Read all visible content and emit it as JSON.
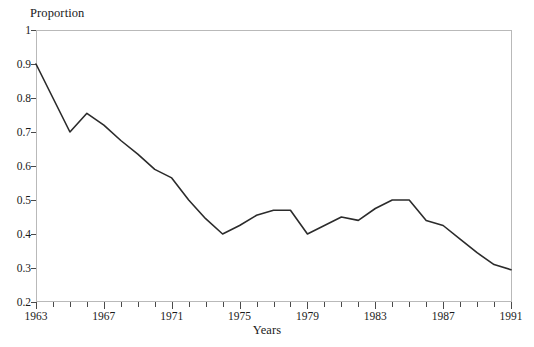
{
  "chart_data": {
    "type": "line",
    "title": "",
    "xlabel": "Years",
    "ylabel": "Proportion",
    "xlim": [
      1963,
      1991
    ],
    "ylim": [
      0.2,
      1.0
    ],
    "grid": false,
    "legend": null,
    "y_ticks": [
      0.2,
      0.3,
      0.4,
      0.5,
      0.6,
      0.7,
      0.8,
      0.9,
      1.0
    ],
    "y_tick_labels": [
      "0.2",
      "0.3",
      "0.4",
      "0.5",
      "0.6",
      "0.7",
      "0.8",
      "0.9",
      "1"
    ],
    "x_ticks": [
      1963,
      1964,
      1965,
      1966,
      1967,
      1968,
      1969,
      1970,
      1971,
      1972,
      1973,
      1974,
      1975,
      1976,
      1977,
      1978,
      1979,
      1980,
      1981,
      1982,
      1983,
      1984,
      1985,
      1986,
      1987,
      1988,
      1989,
      1990,
      1991
    ],
    "x_tick_labels": [
      "1963",
      "1967",
      "1971",
      "1975",
      "1979",
      "1983",
      "1987",
      "1991"
    ],
    "x_labeled_ticks": [
      1963,
      1967,
      1971,
      1975,
      1979,
      1983,
      1987,
      1991
    ],
    "line_color": "#2b2b2b",
    "frame_color": "#b9b9b9",
    "x": [
      1963,
      1964,
      1965,
      1966,
      1967,
      1968,
      1969,
      1970,
      1971,
      1972,
      1973,
      1974,
      1975,
      1976,
      1977,
      1978,
      1979,
      1980,
      1981,
      1982,
      1983,
      1984,
      1985,
      1986,
      1987,
      1988,
      1989,
      1990,
      1991
    ],
    "values": [
      0.9,
      0.8,
      0.7,
      0.755,
      0.72,
      0.675,
      0.635,
      0.59,
      0.565,
      0.5,
      0.445,
      0.4,
      0.425,
      0.455,
      0.47,
      0.47,
      0.4,
      0.425,
      0.45,
      0.44,
      0.475,
      0.5,
      0.5,
      0.44,
      0.425,
      0.385,
      0.345,
      0.31,
      0.295
    ]
  },
  "axis_titles": {
    "y": "Proportion",
    "x": "Years"
  }
}
